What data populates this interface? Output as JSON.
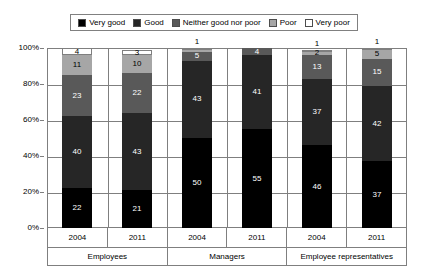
{
  "chart_data": {
    "type": "bar",
    "subtype": "stacked-percentage-column",
    "title": "",
    "xlabel": "",
    "ylabel": "",
    "ylim": [
      0,
      100
    ],
    "y_tick_labels": [
      "0%",
      "20%",
      "40%",
      "60%",
      "80%",
      "100%"
    ],
    "y_tick_values": [
      0,
      20,
      40,
      60,
      80,
      100
    ],
    "grid": true,
    "legend_position": "top",
    "legend": [
      {
        "label": "Very good",
        "color": "#000000"
      },
      {
        "label": "Good",
        "color": "#262626"
      },
      {
        "label": "Neither good nor poor",
        "color": "#595959"
      },
      {
        "label": "Poor",
        "color": "#a6a6a6"
      },
      {
        "label": "Very poor",
        "color": "#ffffff"
      }
    ],
    "groups": [
      {
        "name": "Employees",
        "years": [
          "2004",
          "2011"
        ]
      },
      {
        "name": "Managers",
        "years": [
          "2004",
          "2011"
        ]
      },
      {
        "name": "Employee representatives",
        "years": [
          "2004",
          "2011"
        ]
      }
    ],
    "categories": [
      "Employees 2004",
      "Employees 2011",
      "Managers 2004",
      "Managers 2011",
      "Employee representatives 2004",
      "Employee representatives 2011"
    ],
    "series": [
      {
        "name": "Very good",
        "color": "#000000",
        "values": [
          22,
          21,
          50,
          55,
          46,
          37
        ]
      },
      {
        "name": "Good",
        "color": "#262626",
        "values": [
          40,
          43,
          43,
          41,
          37,
          42
        ]
      },
      {
        "name": "Neither good nor poor",
        "color": "#595959",
        "values": [
          23,
          22,
          5,
          4,
          13,
          15
        ]
      },
      {
        "name": "Poor",
        "color": "#a6a6a6",
        "values": [
          11,
          10,
          1,
          0,
          2,
          5
        ]
      },
      {
        "name": "Very poor",
        "color": "#ffffff",
        "values": [
          4,
          3,
          1,
          0,
          1,
          1
        ]
      }
    ],
    "bars": [
      {
        "group": "Employees",
        "year": "2004",
        "segments": [
          {
            "name": "Very good",
            "value": 22,
            "label": "22",
            "color": "#000000",
            "label_color": "light",
            "label_outside": false
          },
          {
            "name": "Good",
            "value": 40,
            "label": "40",
            "color": "#262626",
            "label_color": "light",
            "label_outside": false
          },
          {
            "name": "Neither good nor poor",
            "value": 23,
            "label": "23",
            "color": "#595959",
            "label_color": "light",
            "label_outside": false
          },
          {
            "name": "Poor",
            "value": 11,
            "label": "11",
            "color": "#a6a6a6",
            "label_color": "dark",
            "label_outside": false
          },
          {
            "name": "Very poor",
            "value": 4,
            "label": "4",
            "color": "#ffffff",
            "label_color": "dark",
            "label_outside": false
          }
        ]
      },
      {
        "group": "Employees",
        "year": "2011",
        "segments": [
          {
            "name": "Very good",
            "value": 21,
            "label": "21",
            "color": "#000000",
            "label_color": "light",
            "label_outside": false
          },
          {
            "name": "Good",
            "value": 43,
            "label": "43",
            "color": "#262626",
            "label_color": "light",
            "label_outside": false
          },
          {
            "name": "Neither good nor poor",
            "value": 22,
            "label": "22",
            "color": "#595959",
            "label_color": "light",
            "label_outside": false
          },
          {
            "name": "Poor",
            "value": 10,
            "label": "10",
            "color": "#a6a6a6",
            "label_color": "dark",
            "label_outside": false
          },
          {
            "name": "Very poor",
            "value": 3,
            "label": "3",
            "color": "#ffffff",
            "label_color": "dark",
            "label_outside": false
          }
        ]
      },
      {
        "group": "Managers",
        "year": "2004",
        "segments": [
          {
            "name": "Very good",
            "value": 50,
            "label": "50",
            "color": "#000000",
            "label_color": "light",
            "label_outside": false
          },
          {
            "name": "Good",
            "value": 43,
            "label": "43",
            "color": "#262626",
            "label_color": "light",
            "label_outside": false
          },
          {
            "name": "Neither good nor poor",
            "value": 5,
            "label": "5",
            "color": "#595959",
            "label_color": "light",
            "label_outside": false
          },
          {
            "name": "Poor",
            "value": 1,
            "label": "",
            "color": "#a6a6a6",
            "label_color": "dark",
            "label_outside": false
          },
          {
            "name": "Very poor",
            "value": 1,
            "label": "1",
            "color": "#ffffff",
            "label_color": "dark",
            "label_outside": true
          }
        ]
      },
      {
        "group": "Managers",
        "year": "2011",
        "segments": [
          {
            "name": "Very good",
            "value": 55,
            "label": "55",
            "color": "#000000",
            "label_color": "light",
            "label_outside": false
          },
          {
            "name": "Good",
            "value": 41,
            "label": "41",
            "color": "#262626",
            "label_color": "light",
            "label_outside": false
          },
          {
            "name": "Neither good nor poor",
            "value": 4,
            "label": "4",
            "color": "#595959",
            "label_color": "light",
            "label_outside": false
          },
          {
            "name": "Poor",
            "value": 0,
            "label": "",
            "color": "#a6a6a6",
            "label_color": "dark",
            "label_outside": false
          },
          {
            "name": "Very poor",
            "value": 0,
            "label": "",
            "color": "#ffffff",
            "label_color": "dark",
            "label_outside": false
          }
        ]
      },
      {
        "group": "Employee representatives",
        "year": "2004",
        "segments": [
          {
            "name": "Very good",
            "value": 46,
            "label": "46",
            "color": "#000000",
            "label_color": "light",
            "label_outside": false
          },
          {
            "name": "Good",
            "value": 37,
            "label": "37",
            "color": "#262626",
            "label_color": "light",
            "label_outside": false
          },
          {
            "name": "Neither good nor poor",
            "value": 13,
            "label": "13",
            "color": "#595959",
            "label_color": "light",
            "label_outside": false
          },
          {
            "name": "Poor",
            "value": 2,
            "label": "2",
            "color": "#a6a6a6",
            "label_color": "dark",
            "label_outside": false
          },
          {
            "name": "Very poor",
            "value": 1,
            "label": "1",
            "color": "#ffffff",
            "label_color": "dark",
            "label_outside": true
          }
        ]
      },
      {
        "group": "Employee representatives",
        "year": "2011",
        "segments": [
          {
            "name": "Very good",
            "value": 37,
            "label": "37",
            "color": "#000000",
            "label_color": "light",
            "label_outside": false
          },
          {
            "name": "Good",
            "value": 42,
            "label": "42",
            "color": "#262626",
            "label_color": "light",
            "label_outside": false
          },
          {
            "name": "Neither good nor poor",
            "value": 15,
            "label": "15",
            "color": "#595959",
            "label_color": "light",
            "label_outside": false
          },
          {
            "name": "Poor",
            "value": 5,
            "label": "5",
            "color": "#a6a6a6",
            "label_color": "dark",
            "label_outside": false
          },
          {
            "name": "Very poor",
            "value": 1,
            "label": "1",
            "color": "#ffffff",
            "label_color": "dark",
            "label_outside": true
          }
        ]
      }
    ]
  }
}
